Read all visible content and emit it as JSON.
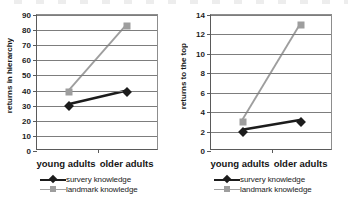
{
  "chart_data": [
    {
      "type": "line",
      "panel": "left",
      "title": "",
      "xlabel": "",
      "ylabel": "returns in hierarchy",
      "categories": [
        "young adults",
        "older adults"
      ],
      "ylim": [
        0,
        90
      ],
      "yticks": [
        0,
        10,
        20,
        30,
        40,
        50,
        60,
        70,
        80,
        90
      ],
      "ytick_labels": [
        "0",
        "10",
        "20",
        "30",
        "40",
        "50",
        "60",
        "70",
        "80",
        "90"
      ],
      "grid": true,
      "legend_position": "bottom",
      "series": [
        {
          "name": "survery knowledge",
          "values": [
            30,
            39
          ],
          "color": "#1c1c1c",
          "marker": "diamond"
        },
        {
          "name": "landmark knowledge",
          "values": [
            39,
            83
          ],
          "color": "#9e9e9e",
          "marker": "square"
        }
      ]
    },
    {
      "type": "line",
      "panel": "right",
      "title": "",
      "xlabel": "",
      "ylabel": "returns to the top",
      "categories": [
        "young adults",
        "older adults"
      ],
      "ylim": [
        0,
        14
      ],
      "yticks": [
        0,
        2,
        4,
        6,
        8,
        10,
        12,
        14
      ],
      "ytick_labels": [
        "0",
        "2",
        "4",
        "6",
        "8",
        "10",
        "12",
        "14"
      ],
      "grid": true,
      "legend_position": "bottom",
      "series": [
        {
          "name": "survery knowledge",
          "values": [
            2,
            3
          ],
          "color": "#1c1c1c",
          "marker": "diamond"
        },
        {
          "name": "landmark knowledge",
          "values": [
            3,
            13
          ],
          "color": "#9e9e9e",
          "marker": "square"
        }
      ]
    }
  ],
  "left": {
    "ylabel": "returns in hierarchy",
    "xlabel_a": "young adults",
    "xlabel_b": "older adults",
    "legend": {
      "survey": "survery knowledge",
      "landmark": "landmark knowledge"
    }
  },
  "right": {
    "ylabel": "returns to the top",
    "xlabel_a": "young adults",
    "xlabel_b": "older adults",
    "legend": {
      "survey": "survery knowledge",
      "landmark": "landmark knowledge"
    }
  }
}
